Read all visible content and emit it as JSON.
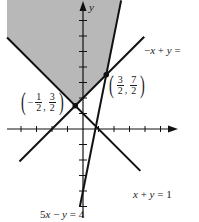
{
  "chart_data": {
    "type": "line",
    "title": "",
    "xlabel": "",
    "ylabel": "y",
    "xlim": [
      -5,
      6
    ],
    "ylim": [
      -6,
      8
    ],
    "x_ticks": [
      -4,
      -3,
      -2,
      -1,
      1,
      2,
      3,
      4,
      5
    ],
    "y_ticks": [
      -5,
      -4,
      -3,
      -2,
      -1,
      1,
      2,
      3,
      4,
      5,
      6,
      7
    ],
    "tick_labels_shown": false,
    "grid": false,
    "series": [
      {
        "name": "x + y = 1",
        "slope": -1,
        "intercept": 1,
        "x_range": [
          -4.9,
          3.7
        ]
      },
      {
        "name": "-x + y = 2",
        "slope": 1,
        "intercept": 2,
        "x_range": [
          -4.5,
          4.5
        ]
      },
      {
        "name": "5x - y = 4",
        "slope": 5,
        "intercept": -4,
        "x_range": [
          -0.2,
          2.45
        ]
      }
    ],
    "annotations": [
      {
        "point": [
          -0.5,
          1.5
        ],
        "label": "(-1/2, 3/2)"
      },
      {
        "point": [
          1.5,
          3.5
        ],
        "label": "(3/2, 7/2)"
      }
    ],
    "shaded_region": {
      "color": "#b8b8b8",
      "vertices": [
        [
          -4.9,
          5.9
        ],
        [
          -0.5,
          1.5
        ],
        [
          1.5,
          3.5
        ],
        [
          2.46,
          8.3
        ],
        [
          -4.9,
          8.3
        ]
      ],
      "bounded_by": [
        "x + y = 1",
        "-x + y = 2",
        "5x - y = 4"
      ]
    },
    "line_labels": {
      "line1": "x + y = 1",
      "line2": "-x + y = 2",
      "line3": "5x - y = 4"
    }
  },
  "labels": {
    "y_axis": "y",
    "line_x_plus_y": {
      "lhs_x": "x",
      "op": "+",
      "lhs_y": "y",
      "eq": "=",
      "rhs": "1"
    },
    "line_neg_x_plus_y": {
      "neg": "−",
      "lhs_x": "x",
      "op": "+",
      "lhs_y": "y",
      "eq": "="
    },
    "line_5x_minus_y": {
      "coef": "5",
      "lhs_x": "x",
      "op": "−",
      "lhs_y": "y",
      "eq": "=",
      "rhs": "4"
    },
    "point_a": {
      "neg": "−",
      "x_num": "1",
      "x_den": "2",
      "y_num": "3",
      "y_den": "2",
      "sep": ","
    },
    "point_b": {
      "x_num": "3",
      "x_den": "2",
      "y_num": "7",
      "y_den": "2",
      "sep": ","
    }
  },
  "colors": {
    "shade": "#b8b8b8",
    "line": "#111111",
    "background": "#ffffff"
  }
}
